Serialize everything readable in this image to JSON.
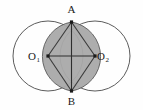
{
  "figure": {
    "canvas": {
      "width": 143,
      "height": 110,
      "background": "#fefefe"
    },
    "colors": {
      "circle_stroke": "#4a4a4a",
      "lens_fill": "#a9a9a9",
      "lens_stroke": "#5a5a5a",
      "rhombus_stroke": "#3a3a3a",
      "diagonal_stroke": "#2e2e2e",
      "point_fill": "#1a1a1a",
      "label_color": "#1a1a1a"
    },
    "circles": [
      {
        "name": "circle-left",
        "cx": 48,
        "cy": 56,
        "r": 35
      },
      {
        "name": "circle-right",
        "cx": 95,
        "cy": 56,
        "r": 35
      }
    ],
    "points": [
      {
        "id": "A",
        "label": "A",
        "sub": "",
        "x": 71.5,
        "y": 22,
        "label_x": 71.5,
        "label_y": 13
      },
      {
        "id": "B",
        "label": "B",
        "sub": "",
        "x": 71.5,
        "y": 91,
        "label_x": 71.5,
        "label_y": 105
      },
      {
        "id": "O1",
        "label": "O",
        "sub": "1",
        "x": 48,
        "y": 56,
        "label_x": 34,
        "label_y": 60
      },
      {
        "id": "O2",
        "label": "O",
        "sub": "2",
        "x": 95,
        "y": 56,
        "label_x": 103,
        "label_y": 60
      }
    ],
    "segments": [
      {
        "name": "segment-O1-A",
        "x1": 48,
        "y1": 56,
        "x2": 71.5,
        "y2": 22
      },
      {
        "name": "segment-A-O2",
        "x1": 71.5,
        "y1": 22,
        "x2": 95,
        "y2": 56
      },
      {
        "name": "segment-O2-B",
        "x1": 95,
        "y1": 56,
        "x2": 71.5,
        "y2": 91
      },
      {
        "name": "segment-B-O1",
        "x1": 71.5,
        "y1": 91,
        "x2": 48,
        "y2": 56
      }
    ],
    "diagonals": [
      {
        "name": "diagonal-A-B",
        "x1": 71.5,
        "y1": 22,
        "x2": 71.5,
        "y2": 91
      },
      {
        "name": "diagonal-O1-O2",
        "x1": 48,
        "y1": 56,
        "x2": 95,
        "y2": 56
      }
    ],
    "lens": {
      "name": "lens-overlap-region",
      "path": "M 71.5 22 A 35 35 0 0 0 71.5 91 A 35 35 0 0 0 71.5 22 Z"
    }
  }
}
